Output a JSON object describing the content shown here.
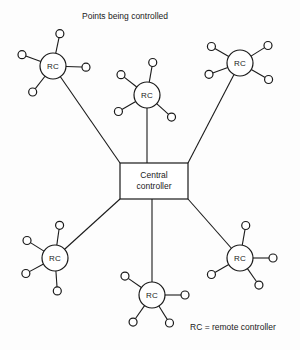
{
  "figure": {
    "title": "Points being controlled",
    "legend": "RC = remote controller",
    "hub": {
      "line1": "Central",
      "line2": "controller",
      "x": 120,
      "y": 163,
      "width": 68,
      "height": 36
    },
    "node_label": "RC",
    "node_radius": 13,
    "point_radius": 4,
    "nodes": [
      {
        "id": "rc-top-left",
        "label": "RC",
        "cx": 53,
        "cy": 66,
        "points": [
          {
            "name": "point-up",
            "angle": -78
          },
          {
            "name": "point-upper-left",
            "angle": -160
          },
          {
            "name": "point-right",
            "angle": 2
          },
          {
            "name": "point-lower-left",
            "angle": 128
          }
        ],
        "hub_anchor": {
          "x": 120,
          "y": 163
        }
      },
      {
        "id": "rc-top-middle",
        "label": "RC",
        "cx": 147,
        "cy": 95,
        "points": [
          {
            "name": "point-up",
            "angle": -80
          },
          {
            "name": "point-upper-left",
            "angle": -142
          },
          {
            "name": "point-lower-left",
            "angle": 150
          },
          {
            "name": "point-lower-right",
            "angle": 42
          }
        ],
        "hub_anchor": {
          "x": 147,
          "y": 163
        }
      },
      {
        "id": "rc-top-right",
        "label": "RC",
        "cx": 240,
        "cy": 63,
        "points": [
          {
            "name": "point-upper-left",
            "angle": -150
          },
          {
            "name": "point-upper-right",
            "angle": -32
          },
          {
            "name": "point-lower-left",
            "angle": 160
          },
          {
            "name": "point-lower-right",
            "angle": 30
          }
        ],
        "hub_anchor": {
          "x": 188,
          "y": 163
        }
      },
      {
        "id": "rc-bottom-left",
        "label": "RC",
        "cx": 55,
        "cy": 258,
        "points": [
          {
            "name": "point-up",
            "angle": -82
          },
          {
            "name": "point-upper-left",
            "angle": -148
          },
          {
            "name": "point-lower-left",
            "angle": 152
          },
          {
            "name": "point-down",
            "angle": 86
          }
        ],
        "hub_anchor": {
          "x": 120,
          "y": 199
        }
      },
      {
        "id": "rc-bottom-middle",
        "label": "RC",
        "cx": 152,
        "cy": 295,
        "points": [
          {
            "name": "point-upper-left",
            "angle": -145
          },
          {
            "name": "point-right",
            "angle": 0
          },
          {
            "name": "point-lower-left",
            "angle": 125
          },
          {
            "name": "point-lower-right",
            "angle": 58
          }
        ],
        "hub_anchor": {
          "x": 152,
          "y": 199
        }
      },
      {
        "id": "rc-bottom-right",
        "label": "RC",
        "cx": 240,
        "cy": 258,
        "points": [
          {
            "name": "point-up",
            "angle": -80
          },
          {
            "name": "point-right",
            "angle": 0
          },
          {
            "name": "point-lower-left",
            "angle": 150
          },
          {
            "name": "point-lower-right",
            "angle": 55
          }
        ],
        "hub_anchor": {
          "x": 188,
          "y": 199
        }
      }
    ]
  }
}
